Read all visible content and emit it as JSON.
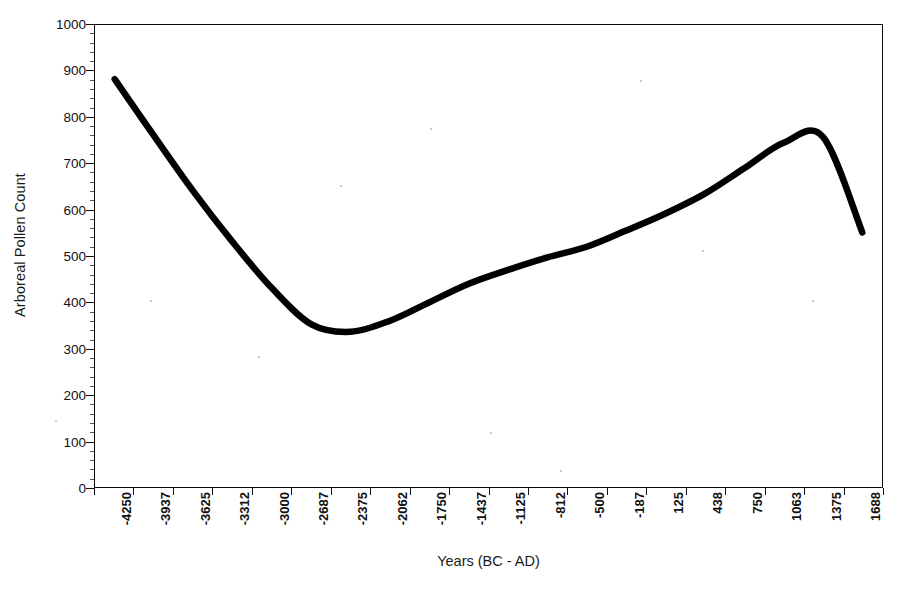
{
  "chart_data": {
    "type": "line",
    "title": "",
    "xlabel": "Years (BC - AD)",
    "ylabel": "Arboreal Pollen Count",
    "xlim": [
      -4250,
      1688
    ],
    "ylim": [
      0,
      1000
    ],
    "grid": false,
    "legend": "none",
    "line_color": "#000000",
    "line_width": 6,
    "categories": [
      "-4250",
      "-3937",
      "-3625",
      "-3312",
      "-3000",
      "-2687",
      "-2375",
      "-2062",
      "-1750",
      "-1437",
      "-1125",
      "-812",
      "-500",
      "-187",
      "125",
      "438",
      "750",
      "1063",
      "1375",
      "1688"
    ],
    "y_ticks": [
      "0",
      "100",
      "200",
      "300",
      "400",
      "500",
      "600",
      "700",
      "800",
      "900",
      "1000"
    ],
    "series": [
      {
        "name": "Arboreal Pollen Count",
        "x": [
          -4250,
          -3937,
          -3625,
          -3312,
          -3000,
          -2687,
          -2375,
          -2062,
          -1750,
          -1437,
          -1125,
          -812,
          -500,
          -187,
          125,
          438,
          750,
          1063,
          1375,
          1688
        ],
        "values": [
          883,
          760,
          640,
          530,
          430,
          352,
          336,
          360,
          400,
          440,
          470,
          497,
          520,
          555,
          592,
          635,
          690,
          745,
          758,
          551
        ]
      }
    ],
    "annotations": {
      "minimum": {
        "x": -2600,
        "value": 334
      },
      "maximum": {
        "x": 1150,
        "value": 758
      },
      "start": {
        "x": -4250,
        "value": 883
      },
      "end": {
        "x": 1688,
        "value": 551
      }
    }
  },
  "axes": {
    "y_title": "Arboreal Pollen Count",
    "x_title": "Years (BC - AD)"
  }
}
